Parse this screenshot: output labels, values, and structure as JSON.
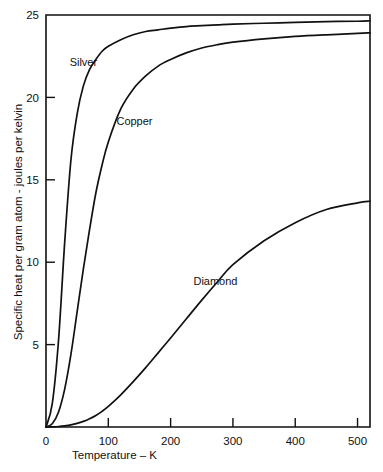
{
  "chart_data": {
    "type": "line",
    "title": "",
    "subtitle": "",
    "xlabel": "Temperature – K",
    "ylabel": "Specific heat per gram atom - joules per kelvin",
    "xlim": [
      0,
      520
    ],
    "ylim": [
      0,
      25
    ],
    "grid": false,
    "legend_position": "inline-annotations",
    "x_ticks": [
      0,
      100,
      200,
      300,
      400,
      500
    ],
    "x_tick_labels": [
      "0",
      "100",
      "200",
      "300",
      "400",
      "500"
    ],
    "y_ticks": [
      5,
      10,
      15,
      20,
      25
    ],
    "y_tick_labels": [
      "5",
      "10",
      "15",
      "20",
      "25"
    ],
    "annotations": [
      {
        "text": "Silver",
        "x": 60,
        "y": 21.9
      },
      {
        "text": "Copper",
        "x": 142,
        "y": 18.3
      },
      {
        "text": "Diamond",
        "x": 272,
        "y": 8.6
      }
    ],
    "x": [
      0,
      10,
      20,
      30,
      40,
      50,
      60,
      70,
      80,
      90,
      100,
      120,
      140,
      160,
      180,
      200,
      225,
      250,
      275,
      300,
      350,
      400,
      450,
      500,
      520
    ],
    "series": [
      {
        "name": "Silver",
        "color": "#111111",
        "values": [
          0.0,
          1.4,
          5.2,
          11.2,
          16.2,
          19.0,
          20.7,
          21.7,
          22.3,
          22.8,
          23.1,
          23.5,
          23.8,
          24.0,
          24.1,
          24.2,
          24.3,
          24.35,
          24.4,
          24.45,
          24.5,
          24.55,
          24.6,
          24.62,
          24.65
        ]
      },
      {
        "name": "Copper",
        "color": "#111111",
        "values": [
          0.0,
          0.2,
          0.9,
          2.3,
          4.4,
          7.0,
          9.6,
          12.0,
          14.2,
          15.9,
          17.3,
          19.3,
          20.5,
          21.3,
          21.9,
          22.3,
          22.7,
          23.0,
          23.2,
          23.35,
          23.55,
          23.7,
          23.8,
          23.88,
          23.92
        ]
      },
      {
        "name": "Diamond",
        "color": "#111111",
        "values": [
          0.0,
          0.01,
          0.03,
          0.07,
          0.13,
          0.22,
          0.34,
          0.5,
          0.7,
          0.95,
          1.25,
          1.95,
          2.75,
          3.6,
          4.5,
          5.4,
          6.55,
          7.7,
          8.8,
          9.85,
          11.3,
          12.4,
          13.2,
          13.6,
          13.7
        ]
      }
    ]
  },
  "axes": {
    "y_axis_title": "Specific heat per gram atom - joules per kelvin",
    "x_axis_title": "Temperature – K"
  }
}
